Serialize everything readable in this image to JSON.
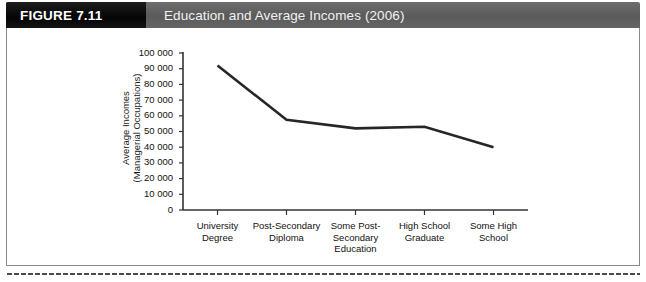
{
  "header": {
    "figure_tag": "FIGURE 7.11",
    "title": "Education and Average Incomes (2006)",
    "tag_bg": "#0a0a0a",
    "bar_bg": "#5f5f5f",
    "title_color": "#f2f2f2"
  },
  "chart_data": {
    "type": "line",
    "title": "Education and Average Incomes (2006)",
    "xlabel": "",
    "ylabel": "Average Incomes\n(Managerial Occupations)",
    "categories": [
      "University\nDegree",
      "Post-Secondary\nDiploma",
      "Some Post-\nSecondary\nEducation",
      "High School\nGraduate",
      "Some High\nSchool"
    ],
    "values": [
      92000,
      57500,
      52000,
      53000,
      40000
    ],
    "ylim": [
      0,
      100000
    ],
    "ytick_labels": [
      "100 000",
      "90 000",
      "80 000",
      "70 000",
      "60 000",
      "50 000",
      "40 000",
      "30 000",
      "20 000",
      "10 000",
      "0"
    ],
    "ytick_values": [
      100000,
      90000,
      80000,
      70000,
      60000,
      50000,
      40000,
      30000,
      20000,
      10000,
      0
    ],
    "grid": false,
    "legend": null,
    "line_color": "#262626"
  }
}
